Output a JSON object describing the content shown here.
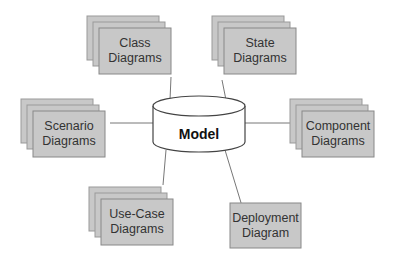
{
  "diagram": {
    "center": {
      "label": "Model",
      "shape": "cylinder"
    },
    "nodes": [
      {
        "id": "class",
        "line1": "Class",
        "line2": "Diagrams",
        "stacked": true
      },
      {
        "id": "state",
        "line1": "State",
        "line2": "Diagrams",
        "stacked": true
      },
      {
        "id": "scenario",
        "line1": "Scenario",
        "line2": "Diagrams",
        "stacked": true
      },
      {
        "id": "component",
        "line1": "Component",
        "line2": "Diagrams",
        "stacked": true
      },
      {
        "id": "usecase",
        "line1": "Use-Case",
        "line2": "Diagrams",
        "stacked": true
      },
      {
        "id": "deployment",
        "line1": "Deployment",
        "line2": "Diagram",
        "stacked": false
      }
    ],
    "colors": {
      "box_fill": "#c8c8c8",
      "box_stroke": "#8a8a8a",
      "line": "#777777",
      "cylinder_fill": "#ffffff"
    }
  }
}
